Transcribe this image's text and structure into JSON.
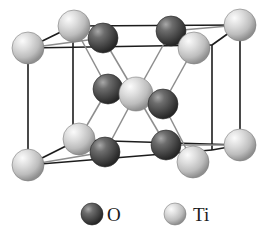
{
  "figure": {
    "background_color": "#ffffff",
    "cell_edge_color": "#1c1c1c",
    "bond_color": "#8a8a8a"
  },
  "legend": {
    "items": [
      {
        "key": "O",
        "label": "O",
        "sphere_type": "oxygen",
        "color": "#4a4a4a",
        "highlight_color": "#9a9a9a",
        "cx": 92,
        "cy": 214,
        "r": 11,
        "label_x": 107,
        "label_y": 221
      },
      {
        "key": "Ti",
        "label": "Ti",
        "sphere_type": "titanium",
        "color": "#c9c9c9",
        "highlight_color": "#f2f2f2",
        "cx": 175,
        "cy": 214,
        "r": 11,
        "label_x": 193,
        "label_y": 221
      }
    ]
  },
  "colors": {
    "oxygen_base": "#4a4a4a",
    "oxygen_dark": "#2e2e2e",
    "oxygen_light": "#9e9e9e",
    "titanium_base": "#cccccc",
    "titanium_dark": "#9b9b9b",
    "titanium_light": "#f6f6f6",
    "edge": "#1c1c1c",
    "bond": "#8d8d8d"
  },
  "structure": {
    "type": "crystal-unit-cell",
    "compound": "TiO2",
    "lattice": "tetragonal (rutile)",
    "cell_vertices": {
      "back_top_left": [
        28,
        48
      ],
      "back_top_right": [
        212,
        26
      ],
      "back_bottom_left": [
        28,
        165
      ],
      "back_bottom_right": [
        212,
        144
      ],
      "front_top_left": [
        73,
        26
      ],
      "front_top_right": [
        240,
        25
      ],
      "front_bottom_left": [
        78,
        135
      ],
      "front_bottom_right": [
        192,
        162
      ]
    },
    "cell_edges": [
      [
        [
          28,
          48
        ],
        [
          73,
          26
        ]
      ],
      [
        [
          73,
          26
        ],
        [
          240,
          25
        ]
      ],
      [
        [
          240,
          25
        ],
        [
          212,
          45
        ]
      ],
      [
        [
          28,
          48
        ],
        [
          212,
          45
        ]
      ],
      [
        [
          28,
          48
        ],
        [
          28,
          165
        ]
      ],
      [
        [
          73,
          26
        ],
        [
          73,
          140
        ]
      ],
      [
        [
          240,
          25
        ],
        [
          240,
          145
        ]
      ],
      [
        [
          212,
          45
        ],
        [
          212,
          150
        ]
      ],
      [
        [
          28,
          165
        ],
        [
          78,
          141
        ]
      ],
      [
        [
          78,
          141
        ],
        [
          240,
          145
        ]
      ],
      [
        [
          28,
          165
        ],
        [
          212,
          150
        ]
      ],
      [
        [
          212,
          150
        ],
        [
          240,
          145
        ]
      ]
    ],
    "atoms": [
      {
        "id": "ti-corner-back-top-left",
        "element": "Ti",
        "x": 28,
        "y": 48,
        "r": 16
      },
      {
        "id": "ti-corner-front-top-left",
        "element": "Ti",
        "x": 74,
        "y": 26,
        "r": 16
      },
      {
        "id": "ti-corner-front-top-right",
        "element": "Ti",
        "x": 240,
        "y": 25,
        "r": 16
      },
      {
        "id": "ti-corner-back-top-right",
        "element": "Ti",
        "x": 194,
        "y": 48,
        "r": 16
      },
      {
        "id": "ti-corner-back-bottom-left",
        "element": "Ti",
        "x": 28,
        "y": 165,
        "r": 16
      },
      {
        "id": "ti-corner-front-bottom-left",
        "element": "Ti",
        "x": 79,
        "y": 139,
        "r": 16
      },
      {
        "id": "ti-corner-front-bottom-right",
        "element": "Ti",
        "x": 240,
        "y": 145,
        "r": 16
      },
      {
        "id": "ti-corner-back-bottom-right",
        "element": "Ti",
        "x": 193,
        "y": 162,
        "r": 16
      },
      {
        "id": "ti-body-center",
        "element": "Ti",
        "x": 136,
        "y": 94,
        "r": 17
      },
      {
        "id": "o-top-left",
        "element": "O",
        "x": 103,
        "y": 38,
        "r": 15
      },
      {
        "id": "o-top-right",
        "element": "O",
        "x": 171,
        "y": 31,
        "r": 15
      },
      {
        "id": "o-mid-left",
        "element": "O",
        "x": 108,
        "y": 89,
        "r": 15
      },
      {
        "id": "o-mid-right",
        "element": "O",
        "x": 163,
        "y": 104,
        "r": 15
      },
      {
        "id": "o-bottom-left",
        "element": "O",
        "x": 105,
        "y": 152,
        "r": 15
      },
      {
        "id": "o-bottom-right",
        "element": "O",
        "x": 166,
        "y": 145,
        "r": 15
      }
    ],
    "bonds": [
      [
        [
          136,
          94
        ],
        [
          103,
          38
        ]
      ],
      [
        [
          136,
          94
        ],
        [
          171,
          31
        ]
      ],
      [
        [
          136,
          94
        ],
        [
          108,
          89
        ]
      ],
      [
        [
          136,
          94
        ],
        [
          163,
          104
        ]
      ],
      [
        [
          136,
          94
        ],
        [
          105,
          152
        ]
      ],
      [
        [
          136,
          94
        ],
        [
          166,
          145
        ]
      ],
      [
        [
          74,
          26
        ],
        [
          103,
          38
        ]
      ],
      [
        [
          194,
          48
        ],
        [
          171,
          31
        ]
      ],
      [
        [
          108,
          89
        ],
        [
          74,
          26
        ]
      ],
      [
        [
          108,
          89
        ],
        [
          79,
          139
        ]
      ],
      [
        [
          163,
          104
        ],
        [
          194,
          48
        ]
      ],
      [
        [
          163,
          104
        ],
        [
          193,
          162
        ]
      ],
      [
        [
          79,
          139
        ],
        [
          105,
          152
        ]
      ],
      [
        [
          193,
          162
        ],
        [
          166,
          145
        ]
      ],
      [
        [
          103,
          38
        ],
        [
          28,
          48
        ]
      ],
      [
        [
          171,
          31
        ],
        [
          240,
          25
        ]
      ],
      [
        [
          105,
          152
        ],
        [
          28,
          165
        ]
      ],
      [
        [
          166,
          145
        ],
        [
          240,
          145
        ]
      ]
    ]
  }
}
